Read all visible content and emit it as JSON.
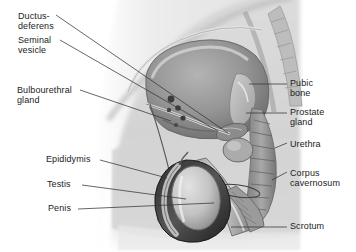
{
  "figure": {
    "style": "grayscale medical illustration",
    "background_color": "#ffffff",
    "label_color": "#1c1c1c",
    "leader_line_color": "#3a3a3a"
  },
  "labels": {
    "ductus_deferens": "Ductus-\ndeferens",
    "seminal_vesicle": "Seminal\nvesicle",
    "bulbourethral_gland": "Bulbourethral\ngland",
    "epididymis": "Epididymis",
    "testis": "Testis",
    "penis": "Penis",
    "pubic_bone": "Pubic\nbone",
    "prostate_gland": "Prostate\ngland",
    "urethra": "Urethra",
    "corpus_cavernosum": "Corpus\ncavernosum",
    "scrotum": "Scrotum"
  },
  "structures": [
    {
      "name": "ductus-deferens",
      "side": "left"
    },
    {
      "name": "seminal-vesicle",
      "side": "left"
    },
    {
      "name": "bulbourethral-gland",
      "side": "left"
    },
    {
      "name": "epididymis",
      "side": "left"
    },
    {
      "name": "testis",
      "side": "left"
    },
    {
      "name": "penis",
      "side": "left"
    },
    {
      "name": "pubic-bone",
      "side": "right"
    },
    {
      "name": "prostate-gland",
      "side": "right"
    },
    {
      "name": "urethra",
      "side": "right"
    },
    {
      "name": "corpus-cavernosum",
      "side": "right"
    },
    {
      "name": "scrotum",
      "side": "right"
    }
  ]
}
